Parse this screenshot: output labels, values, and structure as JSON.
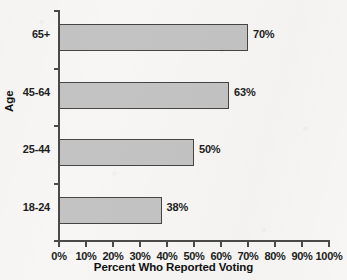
{
  "chart_data": {
    "type": "bar",
    "orientation": "horizontal",
    "title": "",
    "xlabel": "Percent Who Reported Voting",
    "ylabel": "Age",
    "categories": [
      "18-24",
      "25-44",
      "45-64",
      "65+"
    ],
    "values": [
      38,
      50,
      63,
      70
    ],
    "value_labels": [
      "38%",
      "50%",
      "63%",
      "70%"
    ],
    "xlim": [
      0,
      100
    ],
    "xticks": [
      0,
      10,
      20,
      30,
      40,
      50,
      60,
      70,
      80,
      90,
      100
    ],
    "xtick_labels": [
      "0%",
      "10%",
      "20%",
      "30%",
      "40%",
      "50%",
      "60%",
      "70%",
      "80%",
      "90%",
      "100%"
    ],
    "grid": false,
    "legend": null,
    "bar_fill_color": "#c3c3c3",
    "bar_edge_color": "#454545",
    "background_color": "#f7f6f4",
    "series": [
      {
        "name": "Percent Who Reported Voting",
        "points": [
          {
            "category": "65+",
            "value": 70,
            "label": "70%"
          },
          {
            "category": "45-64",
            "value": 63,
            "label": "63%"
          },
          {
            "category": "25-44",
            "value": 50,
            "label": "50%"
          },
          {
            "category": "18-24",
            "value": 38,
            "label": "38%"
          }
        ]
      }
    ]
  }
}
